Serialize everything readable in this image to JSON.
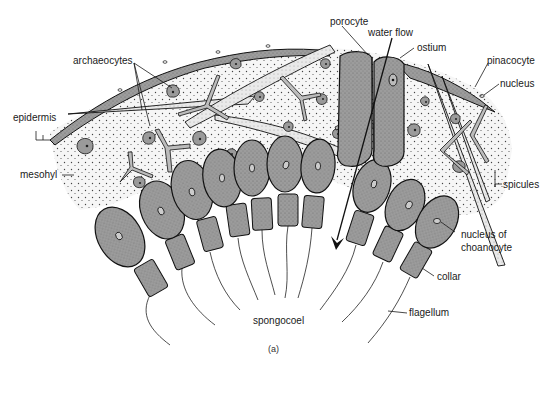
{
  "diagram": {
    "caption": "(a)",
    "colors": {
      "background": "#ffffff",
      "mesohyl_fill": "#f4f4f4",
      "mesohyl_dots": "#555555",
      "cell_fill": "#9a9a9a",
      "cell_stroke": "#111111",
      "spicule_fill": "#e6e6e6",
      "line": "#1a1a1a"
    },
    "labels": {
      "porocyte": "porocyte",
      "water_flow": "water flow",
      "ostium": "ostium",
      "pinacocyte": "pinacocyte",
      "nucleus": "nucleus",
      "archaeocytes": "archaeocytes",
      "epidermis": "epidermis",
      "mesohyl": "mesohyl",
      "spicules": "spicules",
      "nucleus_of_choanocyte_line1": "nucleus of",
      "nucleus_of_choanocyte_line2": "choanocyte",
      "collar": "collar",
      "flagellum": "flagellum",
      "spongocoel": "spongocoel"
    },
    "structures": [
      "epidermis (pinacocyte layer)",
      "mesohyl with dispersed archaeocytes",
      "spicules",
      "porocyte with central ostium",
      "choanocytes with collar and flagellum",
      "spongocoel",
      "water flow arrow"
    ]
  }
}
